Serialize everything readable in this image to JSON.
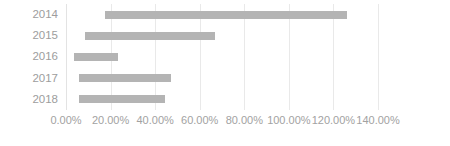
{
  "chart_data": {
    "type": "bar",
    "orientation": "horizontal",
    "subtype": "floating-stacked-bar",
    "title": "",
    "subtitle": "",
    "xlabel": "",
    "ylabel": "",
    "categories": [
      "2014",
      "2015",
      "2016",
      "2017",
      "2018"
    ],
    "xlim": [
      0,
      140
    ],
    "xtick_labels": [
      "0.00%",
      "20.00%",
      "40.00%",
      "60.00%",
      "80.00%",
      "100.00%",
      "120.00%",
      "140.00%"
    ],
    "xtick_values": [
      0,
      20,
      40,
      60,
      80,
      100,
      120,
      140
    ],
    "x_tick_suffix": "%",
    "grid": true,
    "grid_axis": "x",
    "legend": false,
    "legend_position": "none",
    "series": [
      {
        "name": "base",
        "visible": false,
        "values": [
          17.5,
          8.5,
          3.5,
          6.0,
          6.0
        ]
      },
      {
        "name": "range",
        "visible": true,
        "color": "#b4b4b4",
        "values": [
          108.5,
          58.5,
          20.0,
          41.0,
          38.5
        ]
      }
    ],
    "bars": [
      {
        "category": "2014",
        "start": 17.5,
        "end": 126.0,
        "length": 108.5
      },
      {
        "category": "2015",
        "start": 8.5,
        "end": 67.0,
        "length": 58.5
      },
      {
        "category": "2016",
        "start": 3.5,
        "end": 23.5,
        "length": 20.0
      },
      {
        "category": "2017",
        "start": 6.0,
        "end": 47.0,
        "length": 41.0
      },
      {
        "category": "2018",
        "start": 6.0,
        "end": 44.5,
        "length": 38.5
      }
    ]
  },
  "colors": {
    "bar": "#b4b4b4",
    "gridline": "#e9e9e9",
    "axis_text": "#9d9d9d",
    "background": "#ffffff"
  }
}
